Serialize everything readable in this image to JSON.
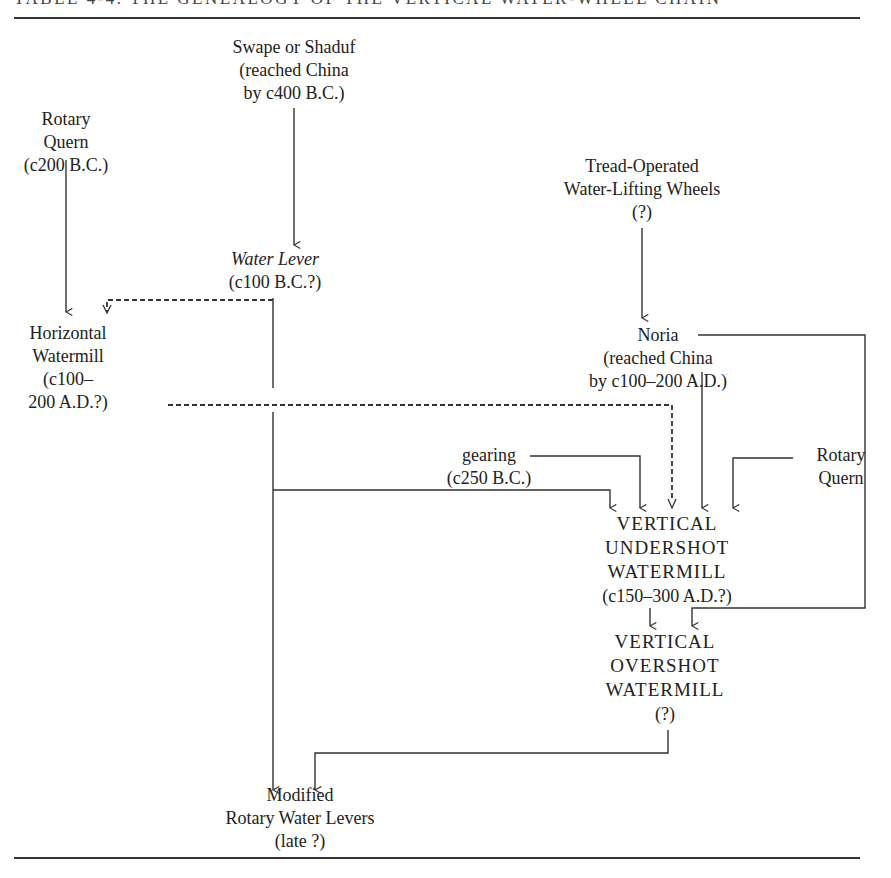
{
  "table": {
    "title": "TABLE 4-4.  THE GENEALOGY OF THE VERTICAL WATER-WHEEL CHAIN"
  },
  "nodes": {
    "swape": {
      "lines": [
        "Swape or Shaduf",
        "(reached China",
        "by c400 B.C.)"
      ]
    },
    "rotary_quern_top": {
      "lines": [
        "Rotary",
        "Quern",
        "(c200 B.C.)"
      ]
    },
    "tread": {
      "lines": [
        "Tread-Operated",
        "Water-Lifting Wheels",
        "(?)"
      ]
    },
    "water_lever": {
      "lines": [
        "Water Lever",
        "(c100 B.C.?)"
      ]
    },
    "horizontal_watermill": {
      "lines": [
        "Horizontal",
        "Watermill",
        "(c100–",
        "200 A.D.?)"
      ]
    },
    "noria": {
      "lines": [
        "Noria",
        "(reached China",
        "by c100–200 A.D.)"
      ]
    },
    "gearing": {
      "lines": [
        "gearing",
        "(c250 B.C.)"
      ]
    },
    "rotary_quern_right": {
      "lines": [
        "Rotary",
        "Quern"
      ]
    },
    "undershot": {
      "lines": [
        "VERTICAL",
        "UNDERSHOT",
        "WATERMILL",
        "(c150–300 A.D.?)"
      ]
    },
    "overshot": {
      "lines": [
        "VERTICAL",
        "OVERSHOT",
        "WATERMILL",
        "(?)"
      ]
    },
    "modified": {
      "lines": [
        "Modified",
        "Rotary Water Levers",
        "(late ?)"
      ]
    }
  },
  "edges": [
    {
      "from": "Swape or Shaduf",
      "to": "Water Lever",
      "style": "solid"
    },
    {
      "from": "Rotary Quern",
      "to": "Horizontal Watermill",
      "style": "solid"
    },
    {
      "from": "Water Lever",
      "to": "Horizontal Watermill",
      "style": "dashed"
    },
    {
      "from": "Water Lever",
      "to": "Modified Rotary Water Levers",
      "style": "solid"
    },
    {
      "from": "Water Lever",
      "to": "Vertical Undershot Watermill",
      "style": "solid"
    },
    {
      "from": "Horizontal Watermill",
      "to": "Vertical Undershot Watermill",
      "style": "dashed"
    },
    {
      "from": "Tread-Operated Water-Lifting Wheels",
      "to": "Noria",
      "style": "solid"
    },
    {
      "from": "Noria",
      "to": "Vertical Undershot Watermill",
      "style": "solid"
    },
    {
      "from": "Noria",
      "to": "Vertical Overshot Watermill",
      "style": "solid"
    },
    {
      "from": "gearing",
      "to": "Vertical Undershot Watermill",
      "style": "solid"
    },
    {
      "from": "Rotary Quern",
      "to": "Vertical Undershot Watermill",
      "style": "solid"
    },
    {
      "from": "Vertical Undershot Watermill",
      "to": "Vertical Overshot Watermill",
      "style": "solid"
    },
    {
      "from": "Vertical Overshot Watermill",
      "to": "Modified Rotary Water Levers",
      "style": "solid"
    }
  ]
}
